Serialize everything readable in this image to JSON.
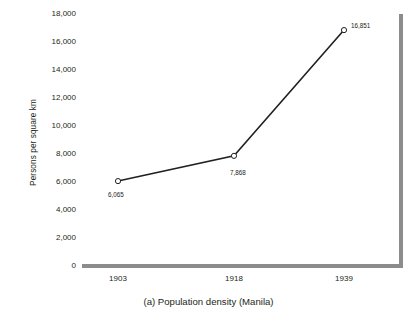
{
  "chart_data": {
    "type": "line",
    "title": "",
    "caption": "(a) Population density (Manila)",
    "xlabel": "",
    "ylabel": "Persons per square km",
    "categories": [
      "1903",
      "1918",
      "1939"
    ],
    "values": [
      6065,
      7868,
      16851
    ],
    "point_labels": [
      "6,065",
      "7,868",
      "16,851"
    ],
    "series": [
      {
        "name": "Population density (Manila)",
        "values": [
          6065,
          7868,
          16851
        ]
      }
    ],
    "ylim": [
      0,
      18000
    ],
    "ytick_values": [
      0,
      2000,
      4000,
      6000,
      8000,
      10000,
      12000,
      14000,
      16000,
      18000
    ],
    "ytick_labels": [
      "0",
      "2,000",
      "4,000",
      "6,000",
      "8,000",
      "10,000",
      "12,000",
      "14,000",
      "16,000",
      "18,000"
    ],
    "grid": false,
    "legend": "none",
    "marker": "open-circle",
    "line_color": "#231f20",
    "marker_color": "#231f20",
    "axis_color": "#8c8c8c",
    "background_color": "#ffffff"
  }
}
